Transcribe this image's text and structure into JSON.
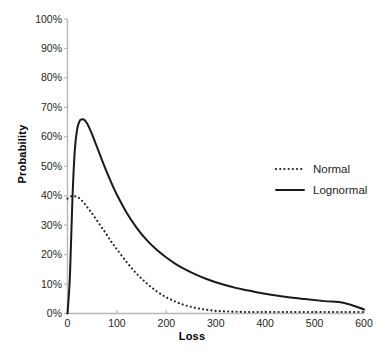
{
  "chart_data": {
    "type": "line",
    "title": "",
    "xlabel": "Loss",
    "ylabel": "Probability",
    "xlim": [
      0,
      600
    ],
    "ylim": [
      0,
      1.0
    ],
    "grid": false,
    "legend_position": "center-right",
    "x_ticks": [
      "0",
      "100",
      "200",
      "300",
      "400",
      "500",
      "600"
    ],
    "x_tick_values": [
      0,
      100,
      200,
      300,
      400,
      500,
      600
    ],
    "y_ticks": [
      "0%",
      "10%",
      "20%",
      "30%",
      "40%",
      "50%",
      "60%",
      "70%",
      "80%",
      "90%",
      "100%"
    ],
    "y_tick_values": [
      0,
      10,
      20,
      30,
      40,
      50,
      60,
      70,
      80,
      90,
      100
    ],
    "x": [
      0,
      5,
      10,
      15,
      20,
      25,
      30,
      35,
      40,
      45,
      50,
      60,
      70,
      80,
      90,
      100,
      120,
      140,
      160,
      180,
      200,
      220,
      240,
      260,
      280,
      300,
      320,
      340,
      360,
      380,
      400,
      440,
      480,
      520,
      560,
      600
    ],
    "series": [
      {
        "name": "Normal",
        "style": "dotted",
        "color": "#231f20",
        "values": [
          39.0,
          39.6,
          39.9,
          39.8,
          39.6,
          39.0,
          38.2,
          37.2,
          36.1,
          35.0,
          33.9,
          31.5,
          29.1,
          26.6,
          24.1,
          21.8,
          17.4,
          13.5,
          10.3,
          7.6,
          5.5,
          3.9,
          2.7,
          1.9,
          1.3,
          0.9,
          0.7,
          0.6,
          0.5,
          0.5,
          0.5,
          0.5,
          0.5,
          0.5,
          0.5,
          0.5
        ]
      },
      {
        "name": "Lognormal",
        "style": "solid",
        "color": "#1a1a1a",
        "values": [
          0.0,
          13.0,
          39.0,
          56.0,
          63.0,
          65.5,
          66.0,
          65.6,
          64.4,
          62.7,
          60.7,
          56.4,
          52.0,
          47.8,
          43.9,
          40.3,
          34.1,
          29.1,
          25.0,
          21.7,
          19.0,
          16.7,
          14.8,
          13.2,
          11.8,
          10.6,
          9.6,
          8.7,
          8.0,
          7.3,
          6.7,
          5.7,
          4.9,
          4.2,
          3.6,
          1.4
        ]
      }
    ],
    "legend": [
      {
        "label": "Normal",
        "style": "dotted"
      },
      {
        "label": "Lognormal",
        "style": "solid"
      }
    ]
  }
}
